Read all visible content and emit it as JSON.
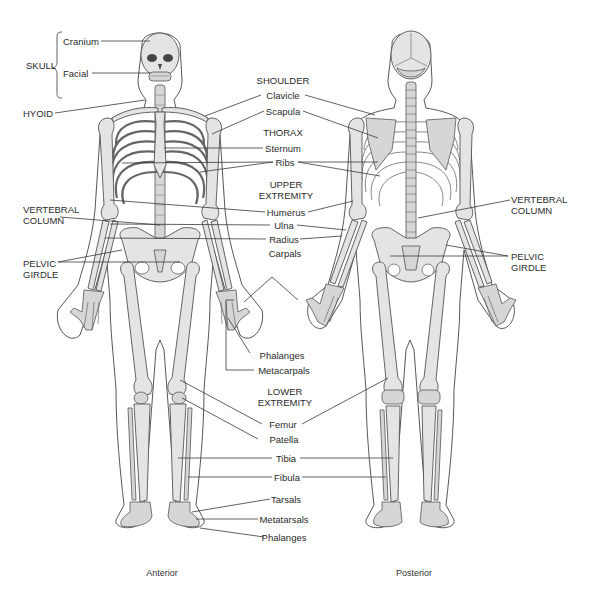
{
  "figure": {
    "views": {
      "anterior": "Anterior",
      "posterior": "Posterior"
    },
    "left_labels": {
      "skull": "SKULL",
      "cranium": "Cranium",
      "facial": "Facial",
      "hyoid": "HYOID",
      "vertebral_column_line1": "VERTEBRAL",
      "vertebral_column_line2": "COLUMN",
      "pelvic_girdle_line1": "PELVIC",
      "pelvic_girdle_line2": "GIRDLE"
    },
    "center_labels": {
      "shoulder": "SHOULDER",
      "clavicle": "Clavicle",
      "scapula": "Scapula",
      "thorax": "THORAX",
      "sternum": "Sternum",
      "ribs": "Ribs",
      "upper_extremity_line1": "UPPER",
      "upper_extremity_line2": "EXTREMITY",
      "humerus": "Humerus",
      "ulna": "Ulna",
      "radius": "Radius",
      "carpals": "Carpals",
      "phalanges_hand": "Phalanges",
      "metacarpals": "Metacarpals",
      "lower_extremity_line1": "LOWER",
      "lower_extremity_line2": "EXTREMITY",
      "femur": "Femur",
      "patella": "Patella",
      "tibia": "Tibia",
      "fibula": "Fibula",
      "tarsals": "Tarsals",
      "metatarsals": "Metatarsals",
      "phalanges_foot": "Phalanges"
    },
    "right_labels": {
      "vertebral_column_line1": "VERTEBRAL",
      "vertebral_column_line2": "COLUMN",
      "pelvic_girdle_line1": "PELVIC",
      "pelvic_girdle_line2": "GIRDLE"
    }
  }
}
